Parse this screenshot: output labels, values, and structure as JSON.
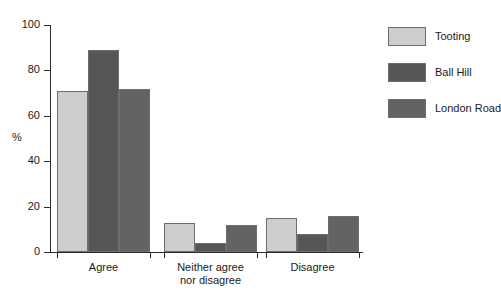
{
  "chart_data": {
    "type": "bar",
    "title": "",
    "xlabel": "",
    "ylabel": "%",
    "ylim": [
      0,
      100
    ],
    "ytick_labels": [
      "0",
      "20",
      "40",
      "60",
      "80",
      "100"
    ],
    "ytick_values": [
      0,
      20,
      40,
      60,
      80,
      100
    ],
    "grid": false,
    "legend_position": "right",
    "categories": [
      "Agree",
      "Neither agree nor disagree",
      "Disagree"
    ],
    "category_labels": [
      {
        "line1": "Agree",
        "line2": ""
      },
      {
        "line1": "Neither agree",
        "line2": "nor disagree"
      },
      {
        "line1": "Disagree",
        "line2": ""
      }
    ],
    "series": [
      {
        "name": "Tooting",
        "color": "#cdcdcd",
        "values": [
          71,
          13,
          15
        ]
      },
      {
        "name": "Ball Hill",
        "color": "#565656",
        "values": [
          89,
          4,
          8
        ]
      },
      {
        "name": "London Road",
        "color": "#636363",
        "values": [
          72,
          12,
          16
        ]
      }
    ]
  },
  "legend": {
    "items": [
      {
        "label": "Tooting",
        "color": "#cdcdcd"
      },
      {
        "label": "Ball Hill",
        "color": "#565656"
      },
      {
        "label": "London Road",
        "color": "#636363"
      }
    ]
  }
}
